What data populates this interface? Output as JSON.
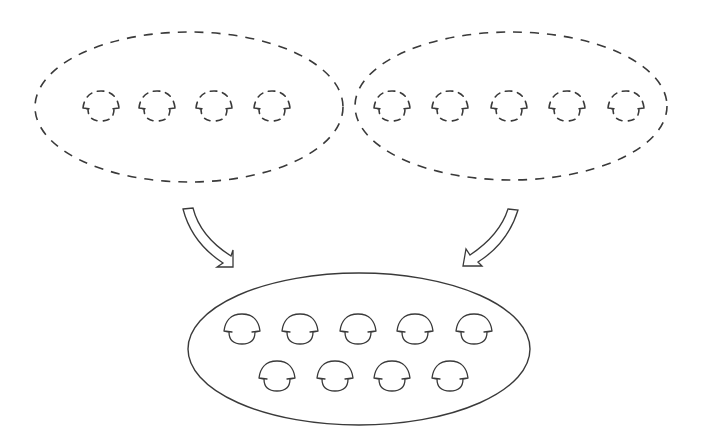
{
  "diagram": {
    "type": "merge-diagram",
    "stroke_color": "#3a3a3a",
    "background": "#ffffff",
    "groups": [
      {
        "id": "left-source-group",
        "style": "dashed",
        "ellipse": {
          "cx": 189,
          "cy": 107,
          "rx": 154,
          "ry": 75
        },
        "unit_count": 4,
        "units": [
          {
            "cx": 101,
            "cy": 107
          },
          {
            "cx": 157,
            "cy": 107
          },
          {
            "cx": 214,
            "cy": 107
          },
          {
            "cx": 272,
            "cy": 107
          }
        ]
      },
      {
        "id": "right-source-group",
        "style": "dashed",
        "ellipse": {
          "cx": 511,
          "cy": 106,
          "rx": 156,
          "ry": 74
        },
        "unit_count": 5,
        "units": [
          {
            "cx": 392,
            "cy": 107
          },
          {
            "cx": 450,
            "cy": 107
          },
          {
            "cx": 509,
            "cy": 107
          },
          {
            "cx": 567,
            "cy": 107
          },
          {
            "cx": 626,
            "cy": 107
          }
        ]
      },
      {
        "id": "merged-result-group",
        "style": "solid",
        "ellipse": {
          "cx": 359,
          "cy": 349,
          "rx": 171,
          "ry": 76
        },
        "unit_count": 9,
        "units": [
          {
            "cx": 242,
            "cy": 330
          },
          {
            "cx": 300,
            "cy": 330
          },
          {
            "cx": 358,
            "cy": 330
          },
          {
            "cx": 415,
            "cy": 330
          },
          {
            "cx": 474,
            "cy": 330
          },
          {
            "cx": 277,
            "cy": 377
          },
          {
            "cx": 335,
            "cy": 377
          },
          {
            "cx": 392,
            "cy": 377
          },
          {
            "cx": 450,
            "cy": 377
          }
        ]
      }
    ],
    "arrows": [
      {
        "id": "left-merge-arrow",
        "from": "left-source-group",
        "to": "merged-result-group",
        "direction": "down-right"
      },
      {
        "id": "right-merge-arrow",
        "from": "right-source-group",
        "to": "merged-result-group",
        "direction": "down-left"
      }
    ]
  }
}
